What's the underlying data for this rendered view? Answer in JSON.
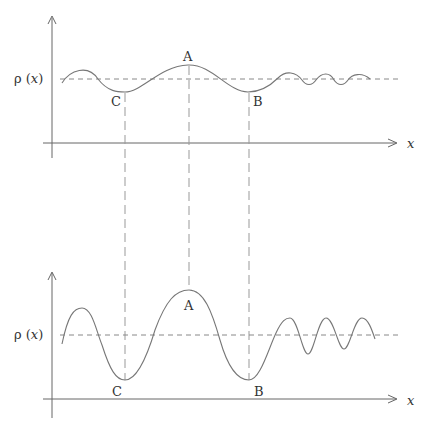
{
  "figure": {
    "colors": {
      "line": "#777777",
      "axis": "#666666",
      "text": "#333333"
    }
  },
  "top_plot": {
    "y_label": "ρ (x)",
    "x_label": "x",
    "points": [
      {
        "name": "A",
        "label": "A",
        "kind": "maximum"
      },
      {
        "name": "B",
        "label": "B",
        "kind": "minimum"
      },
      {
        "name": "C",
        "label": "C",
        "kind": "minimum"
      }
    ],
    "amplitude": "small"
  },
  "bottom_plot": {
    "y_label": "ρ (x)",
    "x_label": "x",
    "points": [
      {
        "name": "A",
        "label": "A",
        "kind": "maximum"
      },
      {
        "name": "B",
        "label": "B",
        "kind": "minimum"
      },
      {
        "name": "C",
        "label": "C",
        "kind": "minimum"
      }
    ],
    "amplitude": "large"
  }
}
